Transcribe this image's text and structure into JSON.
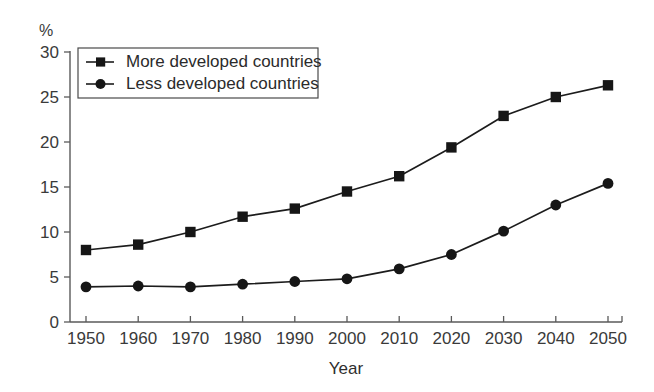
{
  "chart_data": {
    "type": "line",
    "title": "",
    "subtitle": "",
    "xlabel": "Year",
    "ylabel": "",
    "yunit": "%",
    "x": [
      1950,
      1960,
      1970,
      1980,
      1990,
      2000,
      2010,
      2020,
      2030,
      2040,
      2050
    ],
    "categories": [
      "1950",
      "1960",
      "1970",
      "1980",
      "1990",
      "2000",
      "2010",
      "2020",
      "2030",
      "2040",
      "2050"
    ],
    "series": [
      {
        "name": "More developed countries",
        "marker": "square",
        "color": "#161616",
        "values": [
          8.0,
          8.6,
          10.0,
          11.7,
          12.6,
          14.5,
          16.2,
          19.4,
          22.9,
          25.0,
          26.3
        ]
      },
      {
        "name": "Less developed countries",
        "marker": "circle",
        "color": "#161616",
        "values": [
          3.9,
          4.0,
          3.9,
          4.2,
          4.5,
          4.8,
          5.9,
          7.5,
          10.1,
          13.0,
          15.4
        ]
      }
    ],
    "ylim": [
      0,
      30
    ],
    "yticks": [
      0,
      5,
      10,
      15,
      20,
      25,
      30
    ],
    "ytick_labels": [
      "0",
      "5",
      "10",
      "15",
      "20",
      "25",
      "30"
    ],
    "xlim": [
      1945,
      2055
    ],
    "grid": false,
    "legend_position": "top-left"
  },
  "legend": {
    "items": [
      {
        "label": "More developed countries",
        "marker": "square"
      },
      {
        "label": "Less developed countries",
        "marker": "circle"
      }
    ]
  },
  "labels": {
    "y_unit": "%",
    "x_axis_title": "Year"
  }
}
